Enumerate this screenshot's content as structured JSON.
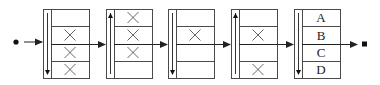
{
  "diagram": {
    "colors": {
      "stroke": "#4a4a4a",
      "fill": "#ffffff",
      "text": "#222222"
    },
    "start_marker": "filled-circle",
    "end_marker": "filled-square",
    "stages": [
      {
        "direction": "down",
        "slots": [
          "",
          "X",
          "X",
          "X"
        ]
      },
      {
        "direction": "up",
        "slots": [
          "X",
          "X",
          "X",
          ""
        ]
      },
      {
        "direction": "down",
        "slots": [
          "",
          "X",
          "",
          ""
        ]
      },
      {
        "direction": "up",
        "slots": [
          "",
          "X",
          "",
          "X"
        ]
      },
      {
        "direction": "down",
        "slots": [
          "A",
          "B",
          "C",
          "D"
        ]
      }
    ]
  }
}
